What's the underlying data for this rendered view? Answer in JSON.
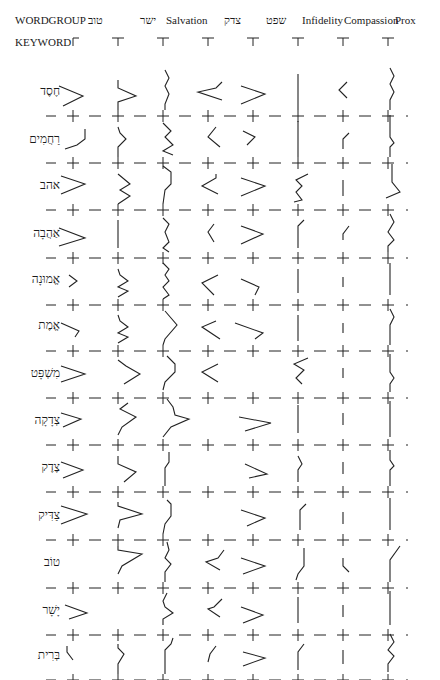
{
  "header": {
    "wordgroup_label": "WORDGROUP",
    "keyword_label": "KEYWORD",
    "columns": [
      {
        "label": "טוב",
        "x": 88
      },
      {
        "label": "ישר",
        "x": 140
      },
      {
        "label": "Salvation",
        "x": 166
      },
      {
        "label": "צדק",
        "x": 224
      },
      {
        "label": "שפט",
        "x": 266
      },
      {
        "label": "Infidelity",
        "x": 302
      },
      {
        "label": "Compassion",
        "x": 344
      },
      {
        "label": "Prox",
        "x": 395
      }
    ]
  },
  "grid": {
    "col_x": [
      73,
      118,
      163,
      208,
      253,
      298,
      343,
      388
    ],
    "stroke_color": "#222222"
  },
  "rows": [
    {
      "keyword": "חֶסֶד",
      "label_y": 92,
      "base_y": 116,
      "glyphs": [
        {
          "col": 0,
          "pts": "-14,-24 10,-14 -10,-4"
        },
        {
          "col": 1,
          "pts": "0,-30 0,-22 18,-14 0,-8 0,0"
        },
        {
          "col": 2,
          "pts": "2,-40 6,-32 2,-24 6,-16 2,-6 2,0"
        },
        {
          "col": 3,
          "pts": "14,-28 8,-22 -10,-18 14,-10"
        },
        {
          "col": 4,
          "pts": "-12,-24 12,-16 -12,-6"
        },
        {
          "col": 5,
          "pts": "0,-36 0,0"
        },
        {
          "col": 6,
          "pts": "4,-28 -4,-20 4,-12"
        },
        {
          "col": 7,
          "pts": "2,-42 6,-34 2,-26 6,-18 2,-10 2,0"
        }
      ]
    },
    {
      "keyword": "רַחֲמִים",
      "label_y": 140,
      "base_y": 163,
      "glyphs": [
        {
          "col": 0,
          "pts": "12,-28 12,-18 4,-12 -8,-8"
        },
        {
          "col": 1,
          "pts": "0,-30 2,-24 8,-18 0,-10 0,0"
        },
        {
          "col": 2,
          "pts": "0,-34 8,-26 2,-20 10,-12 0,-6 10,-2"
        },
        {
          "col": 3,
          "pts": "8,-30 0,-20 12,-10"
        },
        {
          "col": 4,
          "pts": "-10,-26 2,-20 -6,-12"
        },
        {
          "col": 5,
          "pts": "0,-36 0,0"
        },
        {
          "col": 6,
          "pts": "6,-24 0,-18 0,-8"
        },
        {
          "col": 7,
          "pts": "2,-42 2,-20 6,-14 2,-10 2,0"
        }
      ]
    },
    {
      "keyword": "אהב",
      "label_y": 186,
      "base_y": 210,
      "glyphs": [
        {
          "col": 0,
          "pts": "-12,-28 12,-20 -12,-10"
        },
        {
          "col": 1,
          "pts": "0,-30 12,-20 2,-14 12,-8 0,0"
        },
        {
          "col": 2,
          "pts": "0,-38 8,-32 8,-20 2,-14 0,0"
        },
        {
          "col": 3,
          "pts": "8,-30 8,-26 -6,-18 10,-10"
        },
        {
          "col": 4,
          "pts": "-12,-26 12,-18 -12,-8"
        },
        {
          "col": 5,
          "pts": "10,-30 -2,-24 4,-18 -2,-12 4,-4 -4,-2"
        },
        {
          "col": 6,
          "pts": "0,-24 0,-8"
        },
        {
          "col": 7,
          "pts": "4,-40 4,-22 12,-12 -2,-6"
        }
      ]
    },
    {
      "keyword": "אַהֲבָה",
      "label_y": 234,
      "base_y": 258,
      "glyphs": [
        {
          "col": 0,
          "pts": "-14,-24 12,-14 -14,-6"
        },
        {
          "col": 1,
          "pts": "0,-32 0,-4"
        },
        {
          "col": 2,
          "pts": "0,-34 6,-28 2,-20 6,-10 0,-4 6,0"
        },
        {
          "col": 3,
          "pts": "6,-28 0,-20 6,-10"
        },
        {
          "col": 4,
          "pts": "-12,-26 10,-18 -12,-8"
        },
        {
          "col": 5,
          "pts": "6,-32 0,-26 0,-4"
        },
        {
          "col": 6,
          "pts": "6,-26 0,-18 0,-12"
        },
        {
          "col": 7,
          "pts": "2,-38 6,-30 0,-20 6,-12 0,-6 0,0"
        }
      ]
    },
    {
      "keyword": "אֱמוּנָה",
      "label_y": 280,
      "base_y": 305,
      "glyphs": [
        {
          "col": 0,
          "pts": "-4,-24 4,-18 -4,-12"
        },
        {
          "col": 1,
          "pts": "0,-30 2,-24 10,-18 0,-12 10,-8 0,-2"
        },
        {
          "col": 2,
          "pts": "0,-36 6,-30 2,-24 6,-18 0,-12 6,-4 0,0"
        },
        {
          "col": 3,
          "pts": "10,-24 -6,-16 6,-4"
        },
        {
          "col": 4,
          "pts": "-12,-20 6,-12 2,-4"
        },
        {
          "col": 5,
          "pts": "0,-30 0,-6"
        },
        {
          "col": 6,
          "pts": "0,-22 0,-12"
        },
        {
          "col": 7,
          "pts": "2,-36 2,-4"
        }
      ]
    },
    {
      "keyword": "אֱמֶת",
      "label_y": 326,
      "base_y": 351,
      "glyphs": [
        {
          "col": 0,
          "pts": "-12,-22 6,-14 2,-8"
        },
        {
          "col": 1,
          "pts": "0,-30 2,-24 10,-18 0,-12 10,-8 0,-2"
        },
        {
          "col": 2,
          "pts": "2,-34 14,-20 2,-6 0,0"
        },
        {
          "col": 3,
          "pts": "8,-24 -6,-18 12,-6"
        },
        {
          "col": 4,
          "pts": "-18,-22 10,-12 2,-6"
        },
        {
          "col": 5,
          "pts": "0,-30 0,-4"
        },
        {
          "col": 6,
          "pts": "0,-22 0,-12"
        },
        {
          "col": 7,
          "pts": "2,-36 6,-28 2,-20 2,0"
        }
      ]
    },
    {
      "keyword": "מִשְׁפָּט",
      "label_y": 374,
      "base_y": 398,
      "glyphs": [
        {
          "col": 0,
          "pts": "-12,-26 12,-18 -12,-10"
        },
        {
          "col": 1,
          "pts": "0,-32 8,-26 22,-18 6,-8"
        },
        {
          "col": 2,
          "pts": "4,-36 12,-28 12,-20 2,-10 0,-2"
        },
        {
          "col": 3,
          "pts": "10,-28 -6,-20 10,-10"
        },
        {
          "col": 4,
          "pts": "0,0 0,0"
        },
        {
          "col": 5,
          "pts": "10,-34 -4,-28 6,-22 -2,-14 4,-8"
        },
        {
          "col": 6,
          "pts": "0,-24 0,-14"
        },
        {
          "col": 7,
          "pts": "2,-38 2,-20 6,-14 2,-8 2,0"
        }
      ]
    },
    {
      "keyword": "צְדָקָה",
      "label_y": 421,
      "base_y": 445,
      "glyphs": [
        {
          "col": 0,
          "pts": "-12,-26 8,-20 -10,-12"
        },
        {
          "col": 1,
          "pts": "10,-36 2,-30 18,-22 4,-12 0,-4"
        },
        {
          "col": 2,
          "pts": "4,-40 10,-32 12,-24 26,-20 8,-12 0,-2"
        },
        {
          "col": 3,
          "pts": "0,0 0,0"
        },
        {
          "col": 4,
          "pts": "-14,-22 18,-16 -8,-8"
        },
        {
          "col": 5,
          "pts": "0,-34 0,-6"
        },
        {
          "col": 6,
          "pts": "0,-26 0,-14"
        },
        {
          "col": 7,
          "pts": "2,-38 2,-2"
        }
      ]
    },
    {
      "keyword": "צֶדֶק",
      "label_y": 468,
      "base_y": 492,
      "glyphs": [
        {
          "col": 0,
          "pts": "-12,-24 10,-16 -10,-8"
        },
        {
          "col": 1,
          "pts": "0,-30 0,-22 18,-14 6,-4"
        },
        {
          "col": 2,
          "pts": "6,-34 6,-24 2,-18 2,0"
        },
        {
          "col": 3,
          "pts": "0,0 0,0"
        },
        {
          "col": 4,
          "pts": "-8,-22 14,-12 -4,-8"
        },
        {
          "col": 5,
          "pts": "0,-30 4,-22 0,-16 0,-4"
        },
        {
          "col": 6,
          "pts": "0,-24 0,-12"
        },
        {
          "col": 7,
          "pts": "2,-36 2,-26 6,-20 2,-16 2,0"
        }
      ]
    },
    {
      "keyword": "צַדִּיק",
      "label_y": 516,
      "base_y": 540,
      "glyphs": [
        {
          "col": 0,
          "pts": "-12,-28 14,-20 -12,-10"
        },
        {
          "col": 1,
          "pts": "0,-32 0,-28 24,-20 2,-14 0,-6"
        },
        {
          "col": 2,
          "pts": "4,-34 8,-30 8,-18 2,-10 0,0"
        },
        {
          "col": 3,
          "pts": "0,0 0,0"
        },
        {
          "col": 4,
          "pts": "-12,-24 12,-16 -6,-8"
        },
        {
          "col": 5,
          "pts": "8,-30 2,-24 2,-4"
        },
        {
          "col": 6,
          "pts": "0,-22 0,-10"
        },
        {
          "col": 7,
          "pts": "2,-36 2,-4"
        }
      ]
    },
    {
      "keyword": "טוֹב",
      "label_y": 563,
      "base_y": 588,
      "glyphs": [
        {
          "col": 0,
          "pts": "0,0 0,0"
        },
        {
          "col": 1,
          "pts": "0,-36 0,-32 24,-28 4,-16 0,-8"
        },
        {
          "col": 2,
          "pts": "4,-40 6,-32 2,-24 8,-18 2,-10 2,0"
        },
        {
          "col": 3,
          "pts": "16,-32 10,-24 -2,-20 12,-12"
        },
        {
          "col": 4,
          "pts": "-12,-24 12,-16 -10,-8"
        },
        {
          "col": 5,
          "pts": "6,-34 6,-16 0,-8 -2,-2"
        },
        {
          "col": 6,
          "pts": "0,-24 0,-16 6,-10"
        },
        {
          "col": 7,
          "pts": "12,-36 2,-22 2,0"
        }
      ]
    },
    {
      "keyword": "יָשָׁר",
      "label_y": 611,
      "base_y": 635,
      "glyphs": [
        {
          "col": 0,
          "pts": "-8,-24 14,-16 -4,-10"
        },
        {
          "col": 1,
          "pts": "0,0 0,0"
        },
        {
          "col": 2,
          "pts": "4,-36 0,-28 2,-22 10,-16 0,-10 0,-4"
        },
        {
          "col": 3,
          "pts": "14,-30 6,-22 0,-20 12,-12"
        },
        {
          "col": 4,
          "pts": "-12,-22 10,-14 -10,-6"
        },
        {
          "col": 5,
          "pts": "0,-32 0,-6"
        },
        {
          "col": 6,
          "pts": "0,-24 0,-12"
        },
        {
          "col": 7,
          "pts": "2,-38 2,-4"
        }
      ]
    },
    {
      "keyword": "בְּרִית",
      "label_y": 656,
      "base_y": 680,
      "glyphs": [
        {
          "col": 0,
          "pts": "-6,-28 -6,-22 0,-14"
        },
        {
          "col": 1,
          "pts": "0,-30 0,-26 6,-20 0,-10 0,0"
        },
        {
          "col": 2,
          "pts": "10,-36 8,-30 2,-24 2,0"
        },
        {
          "col": 3,
          "pts": "8,-28 2,-20 0,-12"
        },
        {
          "col": 4,
          "pts": "-10,-22 12,-16 -10,-8"
        },
        {
          "col": 5,
          "pts": "6,-30 0,-22 0,-4"
        },
        {
          "col": 6,
          "pts": "0,-24 0,-10"
        },
        {
          "col": 7,
          "pts": "2,-40 6,-32 0,-24 6,-18 0,-10 0,-2"
        }
      ]
    }
  ]
}
